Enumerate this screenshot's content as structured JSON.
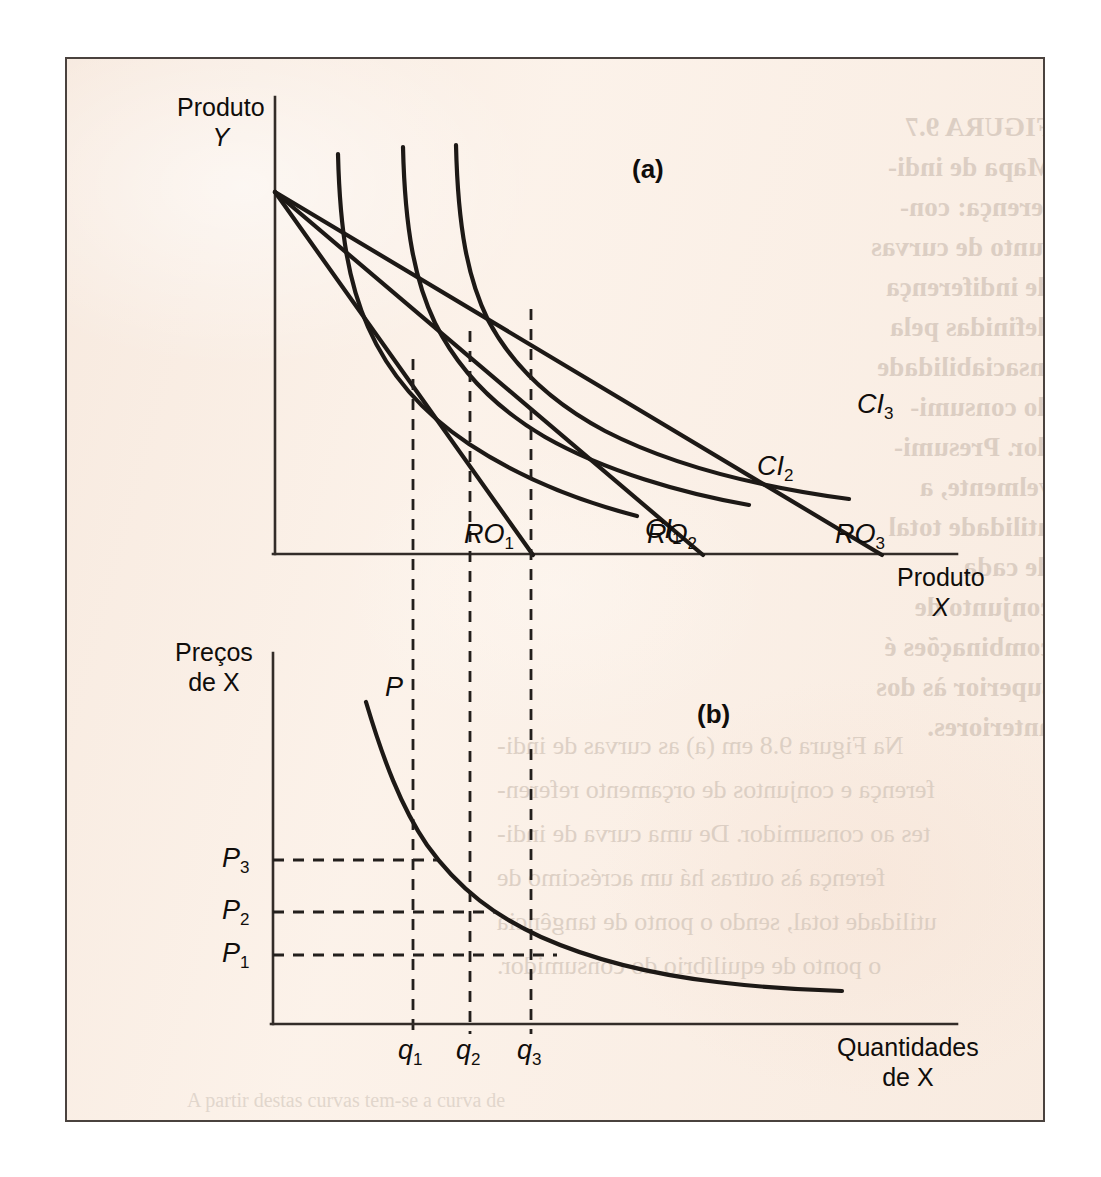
{
  "figure": {
    "panel_a_label": "(a)",
    "panel_b_label": "(b)"
  },
  "panel_a": {
    "y_axis_title_line1": "Produto",
    "y_axis_title_line2": "Y",
    "x_axis_title_line1": "Produto",
    "x_axis_title_line2": "X",
    "indifference_curves": [
      {
        "label": "CI",
        "sub": "1"
      },
      {
        "label": "CI",
        "sub": "2"
      },
      {
        "label": "CI",
        "sub": "3"
      }
    ],
    "budget_lines": [
      {
        "label": "RO",
        "sub": "1"
      },
      {
        "label": "RO",
        "sub": "2"
      },
      {
        "label": "RO",
        "sub": "3"
      }
    ]
  },
  "panel_b": {
    "y_axis_title_line1": "Preços",
    "y_axis_title_line2": "de X",
    "x_axis_title_line1": "Quantidades",
    "x_axis_title_line2": "de X",
    "demand_curve_label": "P",
    "price_ticks": [
      {
        "label": "P",
        "sub": "3"
      },
      {
        "label": "P",
        "sub": "2"
      },
      {
        "label": "P",
        "sub": "1"
      }
    ],
    "quantity_ticks": [
      {
        "label": "q",
        "sub": "1"
      },
      {
        "label": "q",
        "sub": "2"
      },
      {
        "label": "q",
        "sub": "3"
      }
    ]
  },
  "bleed_through": {
    "caption_column": [
      "FIGURA 9.7",
      "Mapa de indi-",
      "ferença: con-",
      "junto de curvas",
      "de indiferença",
      "definidas pela",
      "insaciabilidade",
      "do consumi-",
      "dor. Presumi-",
      "velmente, a",
      "utilidade total",
      "de cada",
      "conjunto de",
      "combinações é",
      "superior às dos",
      "anteriores."
    ],
    "body_lines": [
      "Na Figura 9.8 em (a) as curvas de indi-",
      "ferença e conjuntos de orçamento referen-",
      "tes ao consumidor. De uma curva de indi-",
      "ferença às outras há um acréscimo de",
      "utilidade total, sendo o ponto de tangência",
      "o ponto de equilíbrio do consumidor."
    ],
    "footer_line": "A partir destas curvas tem-se a curva de"
  },
  "chart_data": [
    {
      "type": "line",
      "panel": "(a)",
      "title": "Mapa de indiferença e retas de orçamento",
      "xlabel": "Produto X",
      "ylabel": "Produto Y",
      "grid": false,
      "legend": "inline-labels",
      "series": [
        {
          "name": "RO1",
          "kind": "budget-line",
          "points": [
            [
              0,
              9.8
            ],
            [
              3.65,
              0
            ]
          ]
        },
        {
          "name": "RO2",
          "kind": "budget-line",
          "points": [
            [
              0,
              9.8
            ],
            [
              7.05,
              0
            ]
          ]
        },
        {
          "name": "RO3",
          "kind": "budget-line",
          "points": [
            [
              0,
              9.8
            ],
            [
              10.7,
              0
            ]
          ]
        },
        {
          "name": "CI1",
          "kind": "indifference-curve",
          "points": [
            [
              1.3,
              10.0
            ],
            [
              1.55,
              7.6
            ],
            [
              1.95,
              5.5
            ],
            [
              2.55,
              3.8
            ],
            [
              3.5,
              2.45
            ],
            [
              4.8,
              1.5
            ],
            [
              6.3,
              0.95
            ],
            [
              7.7,
              0.62
            ]
          ]
        },
        {
          "name": "CI2",
          "kind": "indifference-curve",
          "points": [
            [
              2.55,
              10.3
            ],
            [
              2.8,
              8.0
            ],
            [
              3.25,
              6.1
            ],
            [
              3.95,
              4.55
            ],
            [
              5.0,
              3.45
            ],
            [
              6.5,
              2.65
            ],
            [
              8.2,
              2.1
            ],
            [
              9.6,
              1.8
            ]
          ]
        },
        {
          "name": "CI3",
          "kind": "indifference-curve",
          "points": [
            [
              3.55,
              10.3
            ],
            [
              3.85,
              8.1
            ],
            [
              4.35,
              6.35
            ],
            [
              5.15,
              5.05
            ],
            [
              6.35,
              4.2
            ],
            [
              7.95,
              3.6
            ],
            [
              9.8,
              3.2
            ],
            [
              11.3,
              2.95
            ]
          ]
        }
      ],
      "tangency_points": [
        {
          "label": "q1",
          "x": 2.75,
          "y": 2.45
        },
        {
          "label": "q2",
          "x": 3.9,
          "y": 3.45
        },
        {
          "label": "q3",
          "x": 5.15,
          "y": 4.2
        }
      ],
      "dashed_verticals_x": [
        2.75,
        3.9,
        5.15
      ],
      "xlim": [
        0,
        14
      ],
      "ylim": [
        0,
        11
      ]
    },
    {
      "type": "line",
      "panel": "(b)",
      "title": "Curva de demanda do produto X",
      "xlabel": "Quantidades de X",
      "ylabel": "Preços de X",
      "grid": false,
      "series": [
        {
          "name": "P",
          "kind": "demand-curve",
          "points": [
            [
              0.95,
              9.9
            ],
            [
              1.25,
              8.3
            ],
            [
              1.7,
              6.6
            ],
            [
              2.25,
              5.25
            ],
            [
              2.75,
              4.45
            ],
            [
              3.35,
              3.6
            ],
            [
              3.9,
              3.0
            ],
            [
              4.6,
              2.4
            ],
            [
              5.15,
              2.05
            ],
            [
              6.2,
              1.5
            ],
            [
              7.4,
              1.1
            ],
            [
              8.7,
              0.85
            ],
            [
              10.2,
              0.72
            ],
            [
              11.6,
              0.68
            ]
          ]
        }
      ],
      "price_levels": [
        {
          "label": "P3",
          "value": 4.45
        },
        {
          "label": "P2",
          "value": 3.0
        },
        {
          "label": "P1",
          "value": 2.05
        }
      ],
      "quantity_levels": [
        {
          "label": "q1",
          "value": 2.75
        },
        {
          "label": "q2",
          "value": 3.9
        },
        {
          "label": "q3",
          "value": 5.15
        }
      ],
      "xlim": [
        0,
        14
      ],
      "ylim": [
        0,
        11
      ]
    }
  ]
}
